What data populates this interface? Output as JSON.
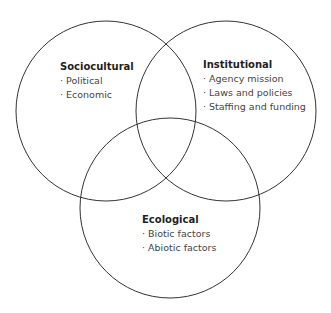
{
  "diagram": {
    "type": "venn",
    "sets": [
      {
        "title": "Sociocultural",
        "items": [
          "· Political",
          "· Economic"
        ]
      },
      {
        "title": "Institutional",
        "items": [
          "· Agency mission",
          "· Laws and policies",
          "· Staffing and funding"
        ]
      },
      {
        "title": "Ecological",
        "items": [
          "· Biotic factors",
          "· Abiotic factors"
        ]
      }
    ],
    "stroke_color": "#333333"
  }
}
